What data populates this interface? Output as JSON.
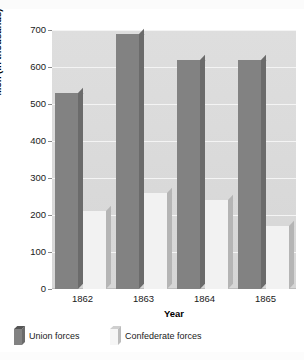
{
  "chart_data": {
    "type": "bar",
    "title": "",
    "xlabel": "Year",
    "ylabel": "Men (in thousands)",
    "categories": [
      "1862",
      "1863",
      "1864",
      "1865"
    ],
    "series": [
      {
        "name": "Union forces",
        "values": [
          530,
          690,
          620,
          620
        ],
        "color": "#828282"
      },
      {
        "name": "Confederate forces",
        "values": [
          210,
          260,
          240,
          170
        ],
        "color": "#f2f2f2"
      }
    ],
    "ylim": [
      0,
      700
    ],
    "yticks": [
      "0",
      "100",
      "200",
      "300",
      "400",
      "500",
      "600",
      "700"
    ],
    "grid": true,
    "legend_position": "bottom-left",
    "style": "3d-clustered-column"
  },
  "legend": {
    "items": [
      {
        "label": "Union forces"
      },
      {
        "label": "Confederate forces"
      }
    ]
  },
  "colors": {
    "plot_background": "#d8d8d8",
    "gridline": "#f4f4f4",
    "union_fill": "#828282",
    "confederate_fill": "#f2f2f2",
    "text": "#1a1a1a"
  }
}
